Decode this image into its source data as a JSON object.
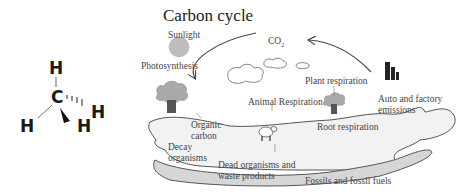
{
  "molecule": {
    "name": "methane",
    "atoms": {
      "center": "C",
      "top": "H",
      "left": "H",
      "front": "H",
      "back": "H"
    },
    "bonds": [
      "line",
      "line",
      "wedge",
      "hash"
    ]
  },
  "diagram": {
    "title": "Carbon cycle",
    "labels": {
      "sunlight": "Sunlight",
      "photosynthesis": "Photosynthesis",
      "co2_main": "CO",
      "co2_sub": "2",
      "plant_respiration": "Plant respiration",
      "animal_respiration": "Animal Respiration",
      "auto_emissions_line1": "Auto and factory",
      "auto_emissions_line2": "emissions",
      "organic_carbon_line1": "Organic",
      "organic_carbon_line2": "carbon",
      "root_respiration": "Root respiration",
      "decay_line1": "Decay",
      "decay_line2": "organisms",
      "dead_line1": "Dead organisms and",
      "dead_line2": "waste products",
      "fossils": "Fossils and fossil fuels"
    },
    "icons": [
      "sun-icon",
      "tree-icon",
      "cloud-icon",
      "sheep-icon",
      "factory-icon",
      "arrow-icon"
    ],
    "colors": {
      "sun": "#bdbdbd",
      "ground": "#f2f2f2",
      "fossil_layer": "#d6d6d6",
      "tree_canopy": "#a9a9a9",
      "tree_trunk": "#555555",
      "outline": "#555555"
    }
  }
}
